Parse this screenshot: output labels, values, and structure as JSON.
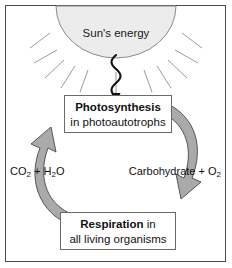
{
  "figure": {
    "border_color": "#4a4a4a",
    "background": "#ffffff"
  },
  "sun": {
    "label": "Sun's energy",
    "fill_color": "#ececec",
    "stroke_color": "#8a8a8a",
    "ray_count": 11
  },
  "energy_arrow": {
    "name": "wavy-energy-arrow",
    "color": "#111111",
    "direction": "down"
  },
  "cycle": {
    "arc_fill": "#aaaaaa",
    "arc_stroke": "#555555",
    "right_arc_direction": "clockwise-down",
    "left_arc_direction": "counterclockwise-up"
  },
  "processes": [
    {
      "name": "photosynthesis",
      "bold_text": "Photosynthesis",
      "normal_text": "in photoautotrophs",
      "layout": "two-line"
    },
    {
      "name": "respiration",
      "bold_text": "Respiration",
      "trailing_text": " in",
      "normal_text": "all living organisms",
      "layout": "bold-inline"
    }
  ],
  "reactants": {
    "left_label_prefix": "CO",
    "left_label_sub1": "2",
    "left_label_mid": " + H",
    "left_label_sub2": "2",
    "left_label_suffix": "O",
    "left_label_plain": "CO2 + H2O"
  },
  "products": {
    "right_label_prefix": "Carbohydrate + O",
    "right_label_sub": "2",
    "right_label_plain": "Carbohydrate + O2"
  }
}
